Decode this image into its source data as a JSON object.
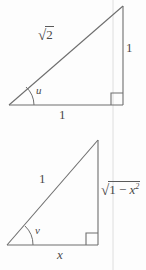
{
  "figure": {
    "background_color": "#fdfdfd",
    "stroke_color": "#6e6e6e",
    "guide_color": "#dcdcdc",
    "text_color": "#4a4a4a",
    "upper_triangle": {
      "name": "upper-right-triangle",
      "hypotenuse_label": {
        "radical_sign": "√",
        "radicand": "2"
      },
      "vertical_leg_label": "1",
      "base_leg_label": "1",
      "angle_label": "u",
      "right_angle_marker": "right-angle-square"
    },
    "lower_triangle": {
      "name": "lower-right-triangle",
      "hypotenuse_label": "1",
      "vertical_leg_label": {
        "radical_sign": "√",
        "radicand_prefix": "1 − ",
        "radicand_base": "x",
        "radicand_exponent": "2"
      },
      "base_leg_label": "x",
      "angle_label": "v",
      "right_angle_marker": "right-angle-square"
    },
    "guide_line": "vertical-guide-line"
  }
}
